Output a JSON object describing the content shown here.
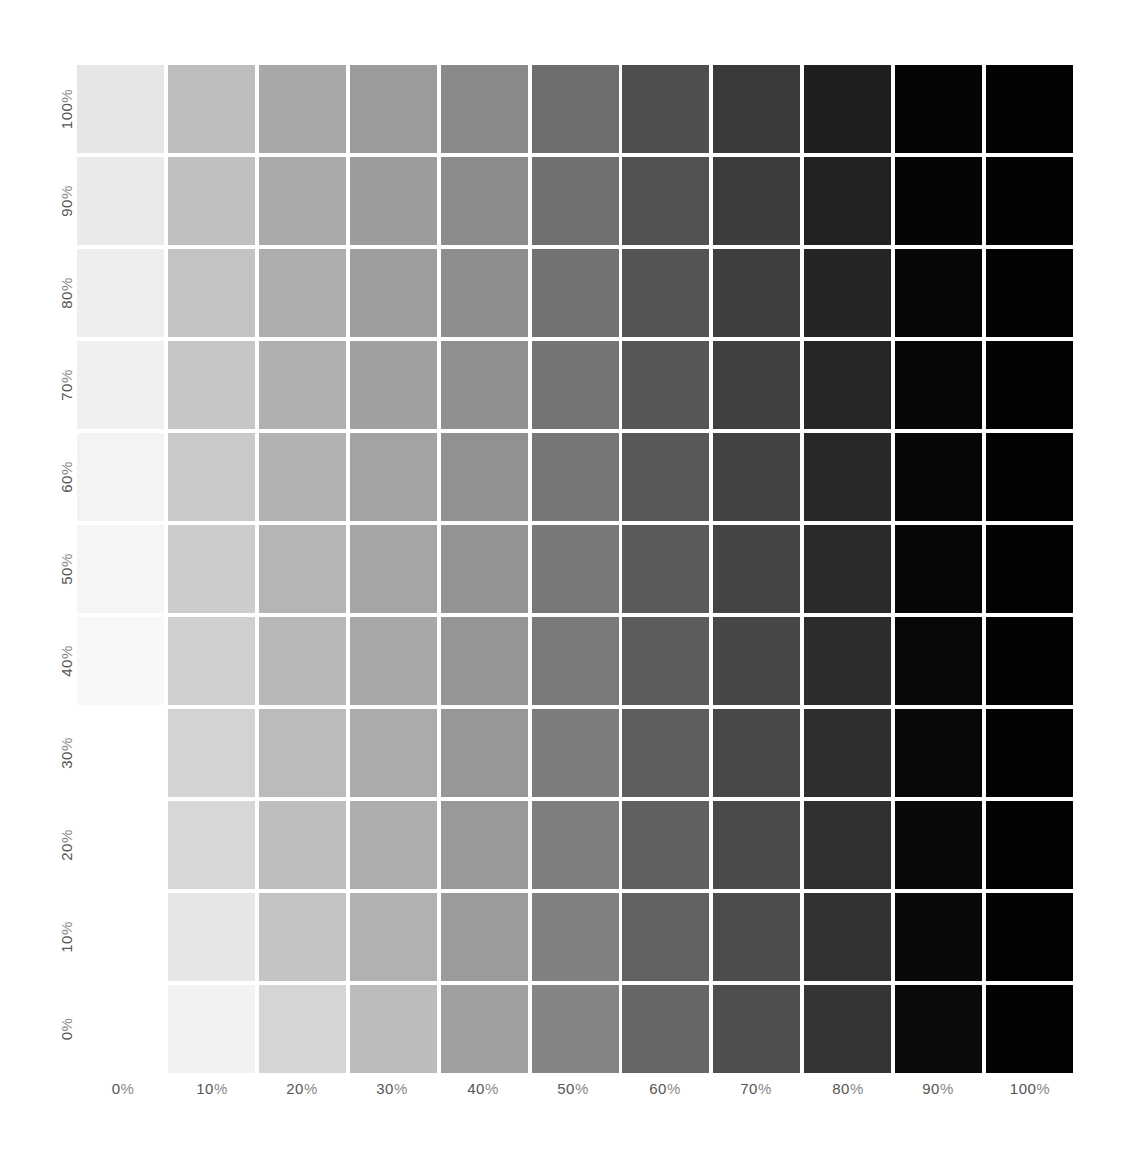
{
  "chart_data": {
    "type": "heatmap",
    "title": "",
    "xlabel": "",
    "ylabel": "",
    "x_categories": [
      "0%",
      "10%",
      "20%",
      "30%",
      "40%",
      "50%",
      "60%",
      "70%",
      "80%",
      "90%",
      "100%"
    ],
    "y_categories_top_to_bottom": [
      "100%",
      "90%",
      "80%",
      "70%",
      "60%",
      "50%",
      "40%",
      "30%",
      "20%",
      "10%",
      "0%"
    ],
    "grid": false,
    "legend": "none",
    "cell_gray_hex_rows_top_to_bottom": [
      [
        "#e6e6e6",
        "#bdbdbd",
        "#a8a8a8",
        "#9b9b9b",
        "#8a8a8a",
        "#6e6e6e",
        "#4f4f4f",
        "#3a3a3a",
        "#1f1f1f",
        "#050505",
        "#020202"
      ],
      [
        "#eaeaea",
        "#c0c0c0",
        "#aaaaaa",
        "#9c9c9c",
        "#8b8b8b",
        "#707070",
        "#525252",
        "#3c3c3c",
        "#222222",
        "#050505",
        "#020202"
      ],
      [
        "#eeeeee",
        "#c3c3c3",
        "#adadad",
        "#9e9e9e",
        "#8d8d8d",
        "#727272",
        "#545454",
        "#3e3e3e",
        "#242424",
        "#060606",
        "#020202"
      ],
      [
        "#f0f0f0",
        "#c6c6c6",
        "#afafaf",
        "#a0a0a0",
        "#8f8f8f",
        "#747474",
        "#565656",
        "#404040",
        "#262626",
        "#060606",
        "#020202"
      ],
      [
        "#f3f3f3",
        "#c9c9c9",
        "#b2b2b2",
        "#a3a3a3",
        "#919191",
        "#767676",
        "#585858",
        "#424242",
        "#282828",
        "#070707",
        "#020202"
      ],
      [
        "#f5f5f5",
        "#cccccc",
        "#b5b5b5",
        "#a5a5a5",
        "#939393",
        "#787878",
        "#5a5a5a",
        "#444444",
        "#2a2a2a",
        "#070707",
        "#020202"
      ],
      [
        "#f8f8f8",
        "#cfcfcf",
        "#b8b8b8",
        "#a8a8a8",
        "#959595",
        "#7a7a7a",
        "#5c5c5c",
        "#464646",
        "#2c2c2c",
        "#080808",
        "#020202"
      ],
      [
        "#ffffff",
        "#d3d3d3",
        "#bbbbbb",
        "#ababab",
        "#979797",
        "#7c7c7c",
        "#5e5e5e",
        "#484848",
        "#2e2e2e",
        "#080808",
        "#020202"
      ],
      [
        "#ffffff",
        "#d7d7d7",
        "#bebebe",
        "#aeaeae",
        "#999999",
        "#7e7e7e",
        "#606060",
        "#4a4a4a",
        "#303030",
        "#090909",
        "#020202"
      ],
      [
        "#ffffff",
        "#e6e6e6",
        "#c4c4c4",
        "#b1b1b1",
        "#9b9b9b",
        "#808080",
        "#626262",
        "#4c4c4c",
        "#323232",
        "#090909",
        "#020202"
      ],
      [
        "#ffffff",
        "#f2f2f2",
        "#d5d5d5",
        "#bcbcbc",
        "#9f9f9f",
        "#848484",
        "#666666",
        "#4e4e4e",
        "#343434",
        "#0a0a0a",
        "#020202"
      ]
    ]
  },
  "axes": {
    "x_labels": [
      {
        "num": "0",
        "pct": "%"
      },
      {
        "num": "10",
        "pct": "%"
      },
      {
        "num": "20",
        "pct": "%"
      },
      {
        "num": "30",
        "pct": "%"
      },
      {
        "num": "40",
        "pct": "%"
      },
      {
        "num": "50",
        "pct": "%"
      },
      {
        "num": "60",
        "pct": "%"
      },
      {
        "num": "70",
        "pct": "%"
      },
      {
        "num": "80",
        "pct": "%"
      },
      {
        "num": "90",
        "pct": "%"
      },
      {
        "num": "100",
        "pct": "%"
      }
    ],
    "y_labels": [
      {
        "num": "100",
        "pct": "%"
      },
      {
        "num": "90",
        "pct": "%"
      },
      {
        "num": "80",
        "pct": "%"
      },
      {
        "num": "70",
        "pct": "%"
      },
      {
        "num": "60",
        "pct": "%"
      },
      {
        "num": "50",
        "pct": "%"
      },
      {
        "num": "40",
        "pct": "%"
      },
      {
        "num": "30",
        "pct": "%"
      },
      {
        "num": "20",
        "pct": "%"
      },
      {
        "num": "10",
        "pct": "%"
      },
      {
        "num": "0",
        "pct": "%"
      }
    ]
  },
  "layout": {
    "background": "#ffffff",
    "gap_color": "#ffffff",
    "label_color": "#555555"
  }
}
